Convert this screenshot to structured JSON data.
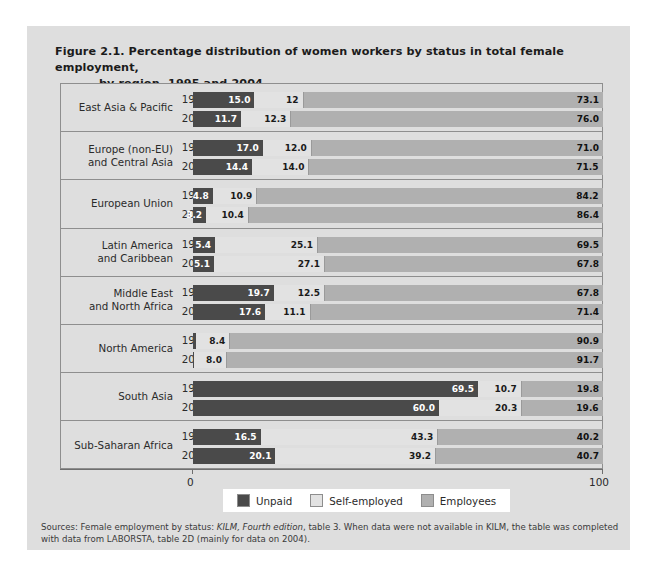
{
  "figure": {
    "title_line1": "Figure 2.1.  Percentage distribution of women workers by status in total female employment,",
    "title_line2": "by region, 1995 and 2004"
  },
  "axis": {
    "min_label": "0",
    "max_label": "100"
  },
  "legend": [
    {
      "label": "Unpaid",
      "color": "#4a4a4a"
    },
    {
      "label": "Self-employed",
      "color": "#e2e2e2"
    },
    {
      "label": "Employees",
      "color": "#b0b0b0"
    }
  ],
  "sources": {
    "prefix": "Sources: Female employment by status: ",
    "italic": "KILM, Fourth edition",
    "suffix": ", table 3. When data were not available in KILM, the table was completed with data from LABORSTA, table 2D (mainly for data on 2004)."
  },
  "chart_data": {
    "type": "bar",
    "subtype": "stacked-horizontal-100",
    "title": "Figure 2.1. Percentage distribution of women workers by status in total female employment, by region, 1995 and 2004",
    "xlabel": "",
    "ylabel": "",
    "xlim": [
      0,
      100
    ],
    "grid": false,
    "legend_position": "bottom",
    "series": [
      {
        "name": "Unpaid",
        "color": "#4a4a4a"
      },
      {
        "name": "Self-employed",
        "color": "#e2e2e2"
      },
      {
        "name": "Employees",
        "color": "#b0b0b0"
      }
    ],
    "regions": [
      {
        "name": "East Asia & Pacific",
        "label_lines": [
          "East Asia & Pacific"
        ],
        "rows": [
          {
            "year": "1995",
            "unpaid": 15.0,
            "self": 12.0,
            "employees": 73.1,
            "unpaid_label": "15.0",
            "self_label": "12",
            "employees_label": "73.1",
            "unpaid_outside": ""
          },
          {
            "year": "2004",
            "unpaid": 11.7,
            "self": 12.3,
            "employees": 76.0,
            "unpaid_label": "11.7",
            "self_label": "12.3",
            "employees_label": "76.0",
            "unpaid_outside": ""
          }
        ]
      },
      {
        "name": "Europe (non-EU) and Central Asia",
        "label_lines": [
          "Europe (non-EU)",
          "and Central Asia"
        ],
        "rows": [
          {
            "year": "1995",
            "unpaid": 17.0,
            "self": 12.0,
            "employees": 71.0,
            "unpaid_label": "17.0",
            "self_label": "12.0",
            "employees_label": "71.0",
            "unpaid_outside": ""
          },
          {
            "year": "2004",
            "unpaid": 14.4,
            "self": 14.0,
            "employees": 71.5,
            "unpaid_label": "14.4",
            "self_label": "14.0",
            "employees_label": "71.5",
            "unpaid_outside": ""
          }
        ]
      },
      {
        "name": "European Union",
        "label_lines": [
          "European Union"
        ],
        "rows": [
          {
            "year": "1995",
            "unpaid": 4.8,
            "self": 10.9,
            "employees": 84.2,
            "unpaid_label": "4.8",
            "self_label": "10.9",
            "employees_label": "84.2",
            "unpaid_outside": ""
          },
          {
            "year": "2004",
            "unpaid": 3.2,
            "self": 10.4,
            "employees": 86.4,
            "unpaid_label": "3.2",
            "self_label": "10.4",
            "employees_label": "86.4",
            "unpaid_outside": ""
          }
        ]
      },
      {
        "name": "Latin America and Caribbean",
        "label_lines": [
          "Latin America",
          "and Caribbean"
        ],
        "rows": [
          {
            "year": "1995",
            "unpaid": 5.4,
            "self": 25.1,
            "employees": 69.5,
            "unpaid_label": "5.4",
            "self_label": "25.1",
            "employees_label": "69.5",
            "unpaid_outside": ""
          },
          {
            "year": "2004",
            "unpaid": 5.1,
            "self": 27.1,
            "employees": 67.8,
            "unpaid_label": "5.1",
            "self_label": "27.1",
            "employees_label": "67.8",
            "unpaid_outside": ""
          }
        ]
      },
      {
        "name": "Middle East and North Africa",
        "label_lines": [
          "Middle East",
          "and North Africa"
        ],
        "rows": [
          {
            "year": "1995",
            "unpaid": 19.7,
            "self": 12.5,
            "employees": 67.8,
            "unpaid_label": "19.7",
            "self_label": "12.5",
            "employees_label": "67.8",
            "unpaid_outside": ""
          },
          {
            "year": "2004",
            "unpaid": 17.6,
            "self": 11.1,
            "employees": 71.4,
            "unpaid_label": "17.6",
            "self_label": "11.1",
            "employees_label": "71.4",
            "unpaid_outside": ""
          }
        ]
      },
      {
        "name": "North America",
        "label_lines": [
          "North America"
        ],
        "rows": [
          {
            "year": "1995",
            "unpaid": 0.7,
            "self": 8.4,
            "employees": 90.9,
            "unpaid_label": "",
            "self_label": "8.4",
            "employees_label": "90.9",
            "unpaid_outside": "0.7"
          },
          {
            "year": "2004",
            "unpaid": 0.3,
            "self": 8.0,
            "employees": 91.7,
            "unpaid_label": "",
            "self_label": "8.0",
            "employees_label": "91.7",
            "unpaid_outside": "0.3"
          }
        ]
      },
      {
        "name": "South Asia",
        "label_lines": [
          "South Asia"
        ],
        "rows": [
          {
            "year": "1995",
            "unpaid": 69.5,
            "self": 10.7,
            "employees": 19.8,
            "unpaid_label": "69.5",
            "self_label": "10.7",
            "employees_label": "19.8",
            "unpaid_outside": ""
          },
          {
            "year": "2004",
            "unpaid": 60.0,
            "self": 20.3,
            "employees": 19.6,
            "unpaid_label": "60.0",
            "self_label": "20.3",
            "employees_label": "19.6",
            "unpaid_outside": ""
          }
        ]
      },
      {
        "name": "Sub-Saharan Africa",
        "label_lines": [
          "Sub-Saharan Africa"
        ],
        "rows": [
          {
            "year": "1995",
            "unpaid": 16.5,
            "self": 43.3,
            "employees": 40.2,
            "unpaid_label": "16.5",
            "self_label": "43.3",
            "employees_label": "40.2",
            "unpaid_outside": ""
          },
          {
            "year": "2004",
            "unpaid": 20.1,
            "self": 39.2,
            "employees": 40.7,
            "unpaid_label": "20.1",
            "self_label": "39.2",
            "employees_label": "40.7",
            "unpaid_outside": ""
          }
        ]
      }
    ]
  }
}
